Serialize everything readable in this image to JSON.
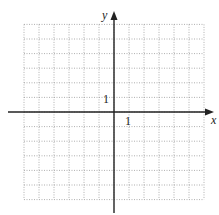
{
  "chart_data": {
    "type": "grid",
    "title": "",
    "xlabel": "x",
    "ylabel": "y",
    "xlim": [
      -6,
      6
    ],
    "ylim": [
      -6,
      6
    ],
    "grid": true,
    "grid_style": "dotted",
    "tick_labels": {
      "x": "1",
      "y": "1"
    },
    "series": []
  },
  "labels": {
    "x_axis": "x",
    "y_axis": "y",
    "x_unit": "1",
    "y_unit": "1"
  },
  "colors": {
    "grid": "#9a9a9a",
    "axis": "#222222"
  }
}
